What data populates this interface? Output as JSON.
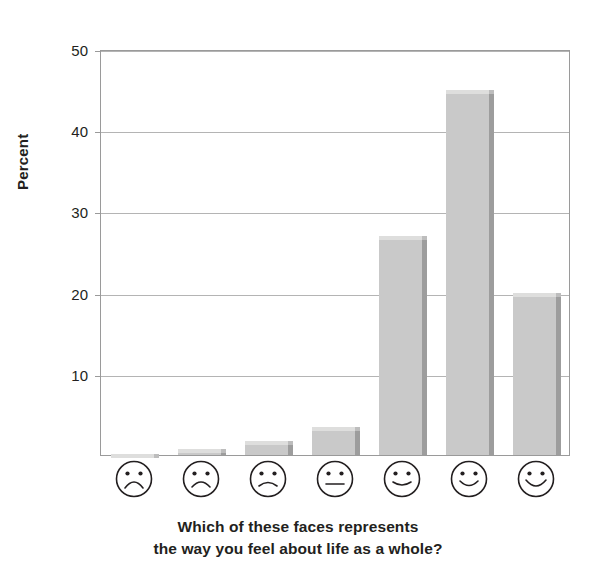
{
  "chart_data": {
    "type": "bar",
    "title": "",
    "subtitle": "",
    "xlabel": "",
    "ylabel": "Percent",
    "ylim": [
      0,
      50
    ],
    "ytick_values": [
      10,
      20,
      30,
      40,
      50
    ],
    "ytick_labels": [
      "10",
      "20",
      "30",
      "40",
      "50"
    ],
    "grid": true,
    "legend": null,
    "categories": [
      "very-sad-face",
      "sad-face",
      "slightly-sad-face",
      "neutral-face",
      "slightly-happy-face",
      "happy-face",
      "very-happy-face"
    ],
    "category_labels": [
      "face 1 (most unhappy)",
      "face 2",
      "face 3",
      "face 4 (neutral)",
      "face 5",
      "face 6",
      "face 7 (most happy)"
    ],
    "values": [
      0.1,
      0.7,
      1.7,
      3.5,
      27.0,
      45.0,
      20.0
    ],
    "annotations": []
  },
  "axis": {
    "y_title": "Percent",
    "ticks": [
      {
        "label": "50",
        "value": 50
      },
      {
        "label": "40",
        "value": 40
      },
      {
        "label": "30",
        "value": 30
      },
      {
        "label": "20",
        "value": 20
      },
      {
        "label": "10",
        "value": 10
      }
    ]
  },
  "caption": {
    "line1": "Which of these faces represents",
    "line2": "the way you feel about life as a whole?"
  },
  "faces": [
    {
      "name": "very-sad-face",
      "mood": "very-sad"
    },
    {
      "name": "sad-face",
      "mood": "sad"
    },
    {
      "name": "slightly-sad-face",
      "mood": "slightly-sad"
    },
    {
      "name": "neutral-face",
      "mood": "neutral"
    },
    {
      "name": "slightly-happy-face",
      "mood": "slightly-happy"
    },
    {
      "name": "happy-face",
      "mood": "happy"
    },
    {
      "name": "very-happy-face",
      "mood": "very-happy"
    }
  ],
  "colors": {
    "bar_fill": "#c9c9c9",
    "bar_top": "#dededd",
    "bar_side": "#9d9d9d",
    "gridline": "#b4b4b4",
    "frame": "#9a9a9a",
    "text": "#231f20",
    "background": "#ffffff"
  }
}
